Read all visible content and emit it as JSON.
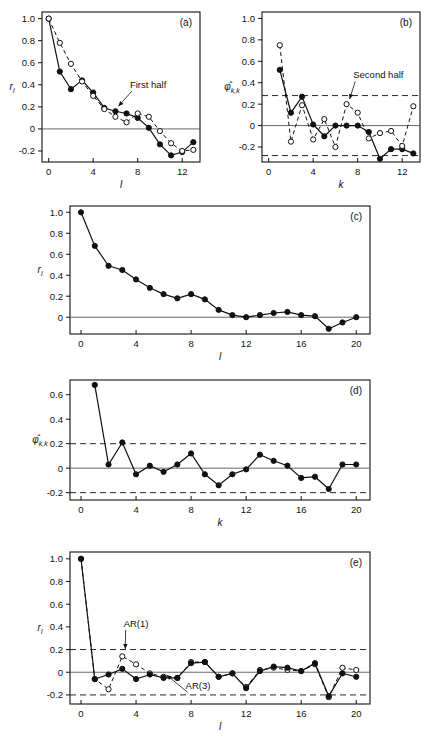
{
  "figure": {
    "panels": [
      "a",
      "b",
      "c",
      "d",
      "e"
    ],
    "label_a": "(a)",
    "label_b": "(b)",
    "label_c": "(c)",
    "label_d": "(d)",
    "label_e": "(e)"
  },
  "chart_data": [
    {
      "id": "a",
      "type": "line",
      "title": "(a)",
      "xlabel": "l",
      "ylabel": "r_l",
      "xlim": [
        -0.6,
        13.6
      ],
      "ylim": [
        -0.3,
        1.06
      ],
      "xticks": [
        0,
        4,
        8,
        12
      ],
      "xticklabels": [
        "0",
        "4",
        "8",
        "12"
      ],
      "yticks": [
        -0.2,
        0,
        0.2,
        0.4,
        0.6,
        0.8,
        1.0
      ],
      "yticklabels": [
        "-0.2",
        "0",
        "0.2",
        "0.4",
        "0.6",
        "0.8",
        "1.0"
      ],
      "grid": false,
      "zero_line": true,
      "bounds": [],
      "annotations": [
        {
          "text": "First half",
          "x": 7.3,
          "y": 0.37,
          "arrow_to_x": 6.0,
          "arrow_to_y": 0.17
        }
      ],
      "series": [
        {
          "name": "First half",
          "marker": "filled-circle",
          "linestyle": "solid",
          "x": [
            0,
            1,
            2,
            3,
            4,
            5,
            6,
            7,
            8,
            9,
            10,
            11,
            12,
            13
          ],
          "values": [
            1.0,
            0.52,
            0.36,
            0.44,
            0.33,
            0.19,
            0.16,
            0.14,
            0.1,
            0.01,
            -0.14,
            -0.24,
            -0.21,
            -0.12
          ]
        },
        {
          "name": "Second half",
          "marker": "open-circle",
          "linestyle": "dashed",
          "x": [
            0,
            1,
            2,
            3,
            4,
            5,
            6,
            7,
            8,
            9,
            10,
            11,
            12,
            13
          ],
          "values": [
            1.0,
            0.78,
            0.59,
            0.43,
            0.3,
            0.18,
            0.11,
            0.06,
            0.14,
            0.11,
            -0.02,
            -0.13,
            -0.2,
            -0.19
          ]
        }
      ]
    },
    {
      "id": "b",
      "type": "line",
      "title": "(b)",
      "xlabel": "k",
      "ylabel": "φ̂_k,k",
      "xlim": [
        -0.6,
        13.6
      ],
      "ylim": [
        -0.34,
        1.06
      ],
      "xticks": [
        0,
        4,
        8,
        12
      ],
      "xticklabels": [
        "0",
        "4",
        "8",
        "12"
      ],
      "yticks": [
        -0.2,
        0,
        0.2,
        0.4,
        0.6,
        0.8,
        1.0
      ],
      "yticklabels": [
        "-0.2",
        "0",
        "0.2",
        "0.4",
        "0.6",
        "0.8",
        "1.0"
      ],
      "grid": false,
      "zero_line": true,
      "bounds": [
        0.28,
        -0.28
      ],
      "annotations": [
        {
          "text": "Second half",
          "x": 7.6,
          "y": 0.44,
          "arrow_to_x": 7.0,
          "arrow_to_y": 0.21
        }
      ],
      "series": [
        {
          "name": "First half",
          "marker": "filled-circle",
          "linestyle": "solid",
          "x": [
            1,
            2,
            3,
            4,
            5,
            6,
            7,
            8,
            9,
            10,
            11,
            12,
            13
          ],
          "values": [
            0.52,
            0.12,
            0.27,
            0.01,
            -0.1,
            0.0,
            0.0,
            0.0,
            -0.06,
            -0.31,
            -0.22,
            -0.22,
            -0.26
          ]
        },
        {
          "name": "Second half",
          "marker": "open-circle",
          "linestyle": "dashed",
          "x": [
            1,
            2,
            3,
            4,
            5,
            6,
            7,
            8,
            9,
            10,
            11,
            12,
            13
          ],
          "values": [
            0.75,
            -0.15,
            0.19,
            -0.13,
            0.06,
            -0.2,
            0.2,
            0.12,
            -0.12,
            -0.07,
            -0.05,
            -0.19,
            0.18
          ]
        }
      ]
    },
    {
      "id": "c",
      "type": "line",
      "title": "(c)",
      "xlabel": "l",
      "ylabel": "r_l",
      "xlim": [
        -0.8,
        21.0
      ],
      "ylim": [
        -0.16,
        1.06
      ],
      "xticks": [
        0,
        4,
        8,
        12,
        16,
        20
      ],
      "xticklabels": [
        "0",
        "4",
        "8",
        "12",
        "16",
        "20"
      ],
      "yticks": [
        0,
        0.2,
        0.4,
        0.6,
        0.8,
        1.0
      ],
      "yticklabels": [
        "0",
        "0.2",
        "0.4",
        "0.6",
        "0.8",
        "1.0"
      ],
      "grid": false,
      "zero_line": true,
      "bounds": [],
      "annotations": [],
      "series": [
        {
          "name": "Sample ACF",
          "marker": "filled-circle",
          "linestyle": "solid",
          "x": [
            0,
            1,
            2,
            3,
            4,
            5,
            6,
            7,
            8,
            9,
            10,
            11,
            12,
            13,
            14,
            15,
            16,
            17,
            18,
            19,
            20
          ],
          "values": [
            1.0,
            0.68,
            0.49,
            0.45,
            0.36,
            0.28,
            0.22,
            0.18,
            0.22,
            0.17,
            0.07,
            0.02,
            0.0,
            0.02,
            0.04,
            0.05,
            0.02,
            0.01,
            -0.11,
            -0.05,
            0.0
          ]
        }
      ]
    },
    {
      "id": "d",
      "type": "line",
      "title": "(d)",
      "xlabel": "k",
      "ylabel": "φ̂_k,k",
      "xlim": [
        -0.8,
        21.0
      ],
      "ylim": [
        -0.26,
        0.72
      ],
      "xticks": [
        0,
        4,
        8,
        12,
        16,
        20
      ],
      "xticklabels": [
        "0",
        "4",
        "8",
        "12",
        "16",
        "20"
      ],
      "yticks": [
        -0.2,
        0,
        0.2,
        0.4,
        0.6
      ],
      "yticklabels": [
        "-0.2",
        "0",
        "0.2",
        "0.4",
        "0.6"
      ],
      "grid": false,
      "zero_line": true,
      "bounds": [
        0.2,
        -0.2
      ],
      "annotations": [],
      "series": [
        {
          "name": "Sample PACF",
          "marker": "filled-circle",
          "linestyle": "solid",
          "x": [
            1,
            2,
            3,
            4,
            5,
            6,
            7,
            8,
            9,
            10,
            11,
            12,
            13,
            14,
            15,
            16,
            17,
            18,
            19,
            20
          ],
          "values": [
            0.68,
            0.03,
            0.21,
            -0.05,
            0.02,
            -0.03,
            0.03,
            0.12,
            -0.05,
            -0.14,
            -0.05,
            -0.01,
            0.11,
            0.06,
            0.02,
            -0.08,
            -0.07,
            -0.17,
            0.03,
            0.03
          ]
        }
      ]
    },
    {
      "id": "e",
      "type": "line",
      "title": "(e)",
      "xlabel": "l",
      "ylabel": "r_l",
      "xlim": [
        -0.8,
        21.0
      ],
      "ylim": [
        -0.28,
        1.06
      ],
      "xticks": [
        0,
        4,
        8,
        12,
        16,
        20
      ],
      "xticklabels": [
        "0",
        "4",
        "8",
        "12",
        "16",
        "20"
      ],
      "yticks": [
        -0.2,
        0,
        0.2,
        0.4,
        0.6,
        0.8,
        1.0
      ],
      "yticklabels": [
        "-0.2",
        "0",
        "0.2",
        "0.4",
        "0.6",
        "0.8",
        "1.0"
      ],
      "grid": false,
      "zero_line": true,
      "bounds": [
        0.2,
        -0.2
      ],
      "annotations": [
        {
          "text": "AR(1)",
          "x": 3.1,
          "y": 0.4,
          "arrow_to_x": 3.0,
          "arrow_to_y": 0.17
        },
        {
          "text": "AR(3)",
          "x": 7.6,
          "y": -0.15,
          "arrow_to_x": 6.0,
          "arrow_to_y": -0.06
        }
      ],
      "series": [
        {
          "name": "AR(1)",
          "marker": "open-circle",
          "linestyle": "dashed",
          "x": [
            0,
            1,
            2,
            3,
            4,
            5,
            6,
            7,
            8,
            9,
            10,
            11,
            12,
            13,
            14,
            15,
            16,
            17,
            18,
            19,
            20
          ],
          "values": [
            1.0,
            -0.06,
            -0.15,
            0.14,
            0.07,
            -0.01,
            -0.04,
            -0.05,
            0.09,
            0.09,
            -0.04,
            -0.01,
            -0.13,
            0.02,
            0.04,
            0.02,
            0.01,
            0.07,
            -0.22,
            0.04,
            0.02
          ]
        },
        {
          "name": "AR(3)",
          "marker": "filled-circle",
          "linestyle": "solid",
          "x": [
            0,
            1,
            2,
            3,
            4,
            5,
            6,
            7,
            8,
            9,
            10,
            11,
            12,
            13,
            14,
            15,
            16,
            17,
            18,
            19,
            20
          ],
          "values": [
            1.0,
            -0.06,
            -0.02,
            0.03,
            -0.06,
            -0.02,
            -0.05,
            -0.05,
            0.08,
            0.09,
            -0.04,
            -0.01,
            -0.14,
            0.01,
            0.05,
            0.04,
            0.01,
            0.08,
            -0.21,
            -0.01,
            -0.04
          ]
        }
      ]
    }
  ]
}
